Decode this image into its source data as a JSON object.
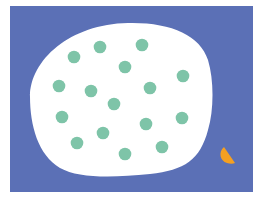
{
  "illustration": {
    "background": {
      "color": "#ffffff"
    },
    "panel": {
      "x": 10,
      "y": 6,
      "width": 243,
      "height": 186,
      "color": "#5b70b6"
    },
    "blob": {
      "color": "#ffffff",
      "path": "M 30 97 C 30 60, 70 24, 128 23 C 170 22, 200 35, 208 60 C 214 80, 214 110, 208 130 C 200 160, 185 170, 150 174 C 110 178, 78 178, 60 168 C 38 155, 30 125, 30 97 Z"
    },
    "dots": {
      "color": "#7ec4a8",
      "radius": 6.3,
      "items": [
        {
          "cx": 74,
          "cy": 57
        },
        {
          "cx": 100,
          "cy": 47
        },
        {
          "cx": 142,
          "cy": 45
        },
        {
          "cx": 125,
          "cy": 67
        },
        {
          "cx": 183,
          "cy": 76
        },
        {
          "cx": 59,
          "cy": 86
        },
        {
          "cx": 91,
          "cy": 91
        },
        {
          "cx": 150,
          "cy": 88
        },
        {
          "cx": 114,
          "cy": 104
        },
        {
          "cx": 62,
          "cy": 117
        },
        {
          "cx": 146,
          "cy": 124
        },
        {
          "cx": 182,
          "cy": 118
        },
        {
          "cx": 103,
          "cy": 133
        },
        {
          "cx": 77,
          "cy": 143
        },
        {
          "cx": 162,
          "cy": 147
        },
        {
          "cx": 125,
          "cy": 154
        }
      ]
    },
    "crescent": {
      "color": "#f5a021",
      "path": "M 224 147 C 218 152, 220 161, 227 163 C 230 164, 233 164, 235 163 Z"
    }
  }
}
